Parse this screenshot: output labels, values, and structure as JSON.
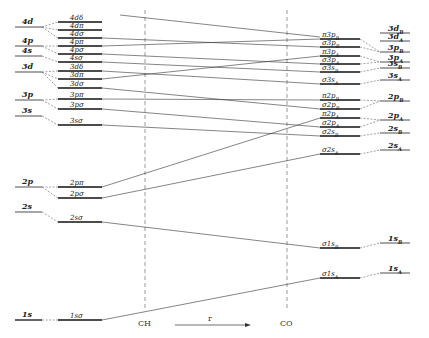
{
  "diagram": {
    "type": "molecular-orbital-correlation-diagram",
    "united_atom_levels": [
      {
        "label": "4d",
        "y": 27
      },
      {
        "label": "4p",
        "y": 46
      },
      {
        "label": "4s",
        "y": 56
      },
      {
        "label": "3d",
        "y": 72
      },
      {
        "label": "3p",
        "y": 100
      },
      {
        "label": "3s",
        "y": 116
      },
      {
        "label": "2p",
        "y": 187
      },
      {
        "label": "2s",
        "y": 212
      },
      {
        "label": "1s",
        "y": 320
      }
    ],
    "united_atom_mo_levels": [
      {
        "label": "4dδ",
        "y": 22
      },
      {
        "label": "4dπ",
        "y": 30
      },
      {
        "label": "4dσ",
        "y": 38
      },
      {
        "label": "4pπ",
        "y": 46
      },
      {
        "label": "4pσ",
        "y": 54
      },
      {
        "label": "4sσ",
        "y": 62
      },
      {
        "label": "3dδ",
        "y": 71
      },
      {
        "label": "3dπ",
        "y": 79
      },
      {
        "label": "3dσ",
        "y": 88
      },
      {
        "label": "3pπ",
        "y": 99
      },
      {
        "label": "3pσ",
        "y": 109
      },
      {
        "label": "3sσ",
        "y": 125
      },
      {
        "label": "2pπ",
        "y": 187
      },
      {
        "label": "2pσ",
        "y": 198
      },
      {
        "label": "2sσ",
        "y": 222
      },
      {
        "label": "1sσ",
        "y": 320
      }
    ],
    "separated_atom_mo_levels": [
      {
        "label": "π3p",
        "sub": "B",
        "y": 39
      },
      {
        "label": "σ3p",
        "sub": "B",
        "y": 47
      },
      {
        "label": "π3p",
        "sub": "A",
        "y": 56
      },
      {
        "label": "σ3p",
        "sub": "A",
        "y": 64
      },
      {
        "label": "σ3s",
        "sub": "B",
        "y": 72
      },
      {
        "label": "σ3s",
        "sub": "A",
        "y": 84
      },
      {
        "label": "π2p",
        "sub": "B",
        "y": 100
      },
      {
        "label": "σ2p",
        "sub": "B",
        "y": 109
      },
      {
        "label": "π2p",
        "sub": "A",
        "y": 118
      },
      {
        "label": "σ2p",
        "sub": "A",
        "y": 127
      },
      {
        "label": "σ2s",
        "sub": "B",
        "y": 136
      },
      {
        "label": "σ2s",
        "sub": "A",
        "y": 154
      },
      {
        "label": "σ1s",
        "sub": "B",
        "y": 248
      },
      {
        "label": "σ1s",
        "sub": "A",
        "y": 278
      }
    ],
    "separated_atom_levels": [
      {
        "label": "3d",
        "sub": "B",
        "y": 33
      },
      {
        "label": "3d",
        "sub": "A",
        "y": 41
      },
      {
        "label": "3p",
        "sub": "B",
        "y": 52
      },
      {
        "label": "3p",
        "sub": "A",
        "y": 62
      },
      {
        "label": "3s",
        "sub": "B",
        "y": 68
      },
      {
        "label": "3s",
        "sub": "A",
        "y": 80
      },
      {
        "label": "2p",
        "sub": "B",
        "y": 101
      },
      {
        "label": "2p",
        "sub": "A",
        "y": 120
      },
      {
        "label": "2s",
        "sub": "B",
        "y": 133
      },
      {
        "label": "2s",
        "sub": "A",
        "y": 150
      },
      {
        "label": "1s",
        "sub": "B",
        "y": 243
      },
      {
        "label": "1s",
        "sub": "A",
        "y": 273
      }
    ],
    "markers": [
      {
        "label": "CH",
        "x": 145
      },
      {
        "label": "CO",
        "x": 287
      }
    ],
    "axis_label": "r"
  }
}
